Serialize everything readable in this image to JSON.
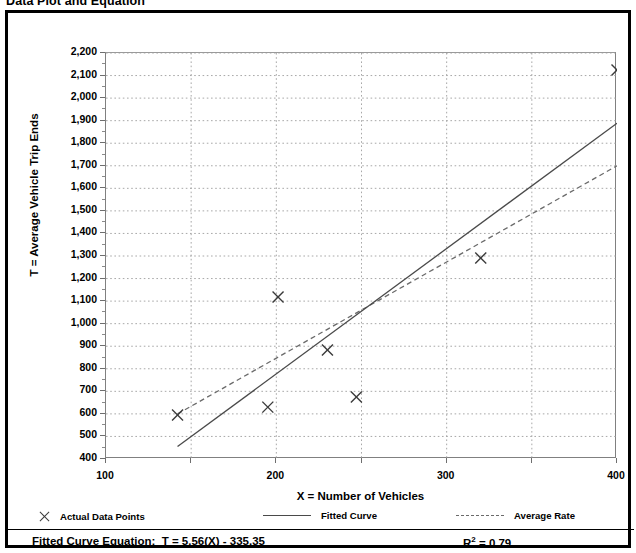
{
  "title": "Data Plot and Equation",
  "chart_data": {
    "type": "scatter",
    "title": "Data Plot and Equation",
    "xlabel": "X = Number of Vehicles",
    "ylabel": "T = Average Vehicle Trip Ends",
    "xlim": [
      100,
      400
    ],
    "ylim": [
      400,
      2200
    ],
    "xticks": [
      100,
      200,
      300,
      400
    ],
    "xticks_minor": [
      150,
      250,
      350
    ],
    "yticks": [
      400,
      500,
      600,
      700,
      800,
      900,
      1000,
      1100,
      1200,
      1300,
      1400,
      1500,
      1600,
      1700,
      1800,
      1900,
      2000,
      2100,
      2200
    ],
    "ytick_labels": [
      "400",
      "500",
      "600",
      "700",
      "800",
      "900",
      "1,000",
      "1,100",
      "1,200",
      "1,300",
      "1,400",
      "1,500",
      "1,600",
      "1,700",
      "1,800",
      "1,900",
      "2,000",
      "2,100",
      "2,200"
    ],
    "xtick_labels": [
      "100",
      "200",
      "300",
      "400"
    ],
    "grid": true,
    "grid_style": "dotted",
    "legend_position": "bottom",
    "series": [
      {
        "name": "Actual Data Points",
        "type": "scatter",
        "marker": "x",
        "points": [
          {
            "x": 142,
            "y": 595
          },
          {
            "x": 195,
            "y": 630
          },
          {
            "x": 201,
            "y": 1118
          },
          {
            "x": 230,
            "y": 883
          },
          {
            "x": 247,
            "y": 675
          },
          {
            "x": 320,
            "y": 1291
          },
          {
            "x": 400,
            "y": 2125
          }
        ]
      },
      {
        "name": "Fitted Curve",
        "type": "line",
        "style": "solid",
        "endpoints": [
          {
            "x": 142,
            "y": 455
          },
          {
            "x": 400,
            "y": 1889
          }
        ],
        "equation": "T = 5.56(X) - 335.35",
        "slope": 5.56,
        "intercept": -335.35
      },
      {
        "name": "Average Rate",
        "type": "line",
        "style": "dashed",
        "endpoints": [
          {
            "x": 142,
            "y": 600
          },
          {
            "x": 400,
            "y": 1700
          }
        ]
      }
    ],
    "r_squared": 0.79,
    "annotations": {
      "equation_label": "Fitted Curve Equation:",
      "equation_text": "T = 5.56(X) - 335.35",
      "r2_label": "R",
      "r2_exponent": "2",
      "r2_value": "= 0.79"
    }
  },
  "legend": {
    "items": [
      {
        "label": "Actual Data Points",
        "marker": "x-marker"
      },
      {
        "label": "Fitted Curve",
        "marker": "solid-line"
      },
      {
        "label": "Average Rate",
        "marker": "dashed-line"
      }
    ]
  },
  "colors": {
    "border": "#000000",
    "axis": "#808080",
    "grid": "#9e9e9e",
    "fitted_line": "#4a4a4a",
    "average_line": "#6a6a6a",
    "marker": "#3a3a3a",
    "background": "#ffffff"
  }
}
